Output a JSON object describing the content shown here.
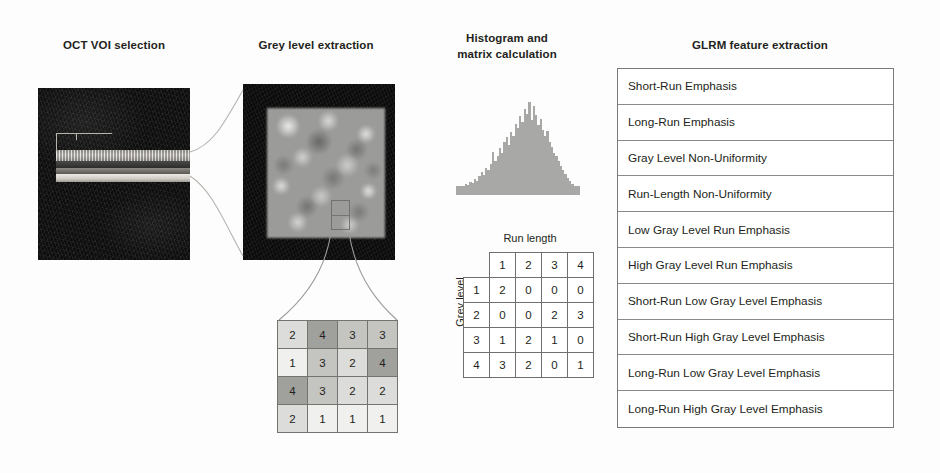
{
  "headings": {
    "oct": "OCT VOI selection",
    "grey": "Grey level extraction",
    "histogram_line1": "Histogram and",
    "histogram_line2": "matrix calculation",
    "glrm": "GLRM feature extraction"
  },
  "matrix": {
    "runlength_label": "Run length",
    "greylevel_label": "Grey level",
    "col_headers": [
      "1",
      "2",
      "3",
      "4"
    ],
    "row_headers": [
      "1",
      "2",
      "3",
      "4"
    ],
    "rows": [
      [
        "2",
        "0",
        "0",
        "0"
      ],
      [
        "0",
        "0",
        "2",
        "3"
      ],
      [
        "1",
        "2",
        "1",
        "0"
      ],
      [
        "3",
        "2",
        "0",
        "1"
      ]
    ]
  },
  "value_grid": {
    "rows": [
      [
        "2",
        "4",
        "3",
        "3"
      ],
      [
        "1",
        "3",
        "2",
        "4"
      ],
      [
        "4",
        "3",
        "2",
        "2"
      ],
      [
        "2",
        "1",
        "1",
        "1"
      ]
    ]
  },
  "features": [
    "Short-Run Emphasis",
    "Long-Run Emphasis",
    "Gray Level Non-Uniformity",
    "Run-Length Non-Uniformity",
    "Low Gray Level Run Emphasis",
    "High Gray Level Run Emphasis",
    "Short-Run Low Gray Level Emphasis",
    "Short-Run High Gray Level Emphasis",
    "Long-Run Low Gray Level Emphasis",
    "Long-Run High Gray Level Emphasis"
  ],
  "chart_data": {
    "type": "bar",
    "title": "Histogram and matrix calculation",
    "xlabel": "",
    "ylabel": "",
    "grid": false,
    "legend": "none",
    "bar_color": "#a8a8a6",
    "values": [
      6,
      8,
      7,
      10,
      9,
      12,
      11,
      15,
      13,
      18,
      22,
      19,
      26,
      24,
      30,
      42,
      33,
      38,
      46,
      41,
      52,
      57,
      49,
      62,
      58,
      70,
      66,
      78,
      72,
      85,
      80,
      92,
      74,
      88,
      79,
      69,
      75,
      64,
      58,
      63,
      52,
      47,
      41,
      38,
      33,
      28,
      24,
      20,
      16,
      13,
      10,
      8,
      6
    ]
  },
  "icons": {
    "voi_bracket": "voi-bracket-marker",
    "roi_box": "roi-selection-box"
  },
  "colors": {
    "text": "#231f20",
    "border": "#7a7a78",
    "histogram_bar": "#a8a8a6",
    "grid_level_1": "#f0f0ee",
    "grid_level_2": "#dcdcda",
    "grid_level_3": "#c4c4c1",
    "grid_level_4": "#a0a09d"
  }
}
